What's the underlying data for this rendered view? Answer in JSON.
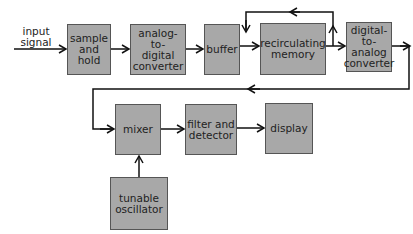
{
  "diagram": {
    "input_label": "input\nsignal",
    "blocks": {
      "sample_hold": "sample\nand\nhold",
      "adc": "analog-to-\ndigital\nconverter",
      "buffer": "buffer",
      "memory": "recirculating\nmemory",
      "dac": "digital-\nto-\nanalog\nconverter",
      "mixer": "mixer",
      "filter": "filter and\ndetector",
      "display": "display",
      "oscillator": "tunable\noscillator"
    },
    "colors": {
      "block_fill": "#a8a8a8",
      "block_border": "#555555",
      "line": "#111111",
      "background": "#ffffff"
    },
    "connections": [
      [
        "input",
        "sample_hold"
      ],
      [
        "sample_hold",
        "adc"
      ],
      [
        "adc",
        "buffer"
      ],
      [
        "buffer",
        "memory"
      ],
      [
        "memory",
        "memory (recirculation loop)"
      ],
      [
        "memory",
        "dac"
      ],
      [
        "dac",
        "mixer"
      ],
      [
        "mixer",
        "filter"
      ],
      [
        "filter",
        "display"
      ],
      [
        "oscillator",
        "mixer"
      ]
    ]
  }
}
